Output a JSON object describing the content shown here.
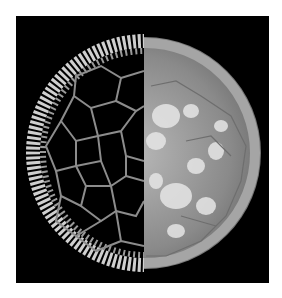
{
  "image": {
    "subject": "microscopy cross-section of plant stem, split view",
    "left_half": "dark-field cell walls",
    "right_half": "bright-field grayscale tissue",
    "background_color": "#000000",
    "page_color": "#ffffff"
  }
}
